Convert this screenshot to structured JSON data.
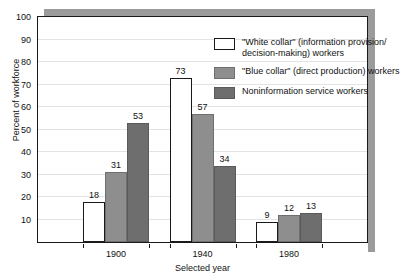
{
  "chart_data": {
    "type": "bar",
    "title": "",
    "xlabel": "Selected year",
    "ylabel": "Percent of workforce",
    "categories": [
      "1900",
      "1940",
      "1980"
    ],
    "series": [
      {
        "name": "\"White collar\" (information provision/decision-making) workers",
        "legend_line1": "\"White collar\" (information provision/",
        "legend_line2": "decision-making) workers",
        "color": "#ffffff",
        "values": [
          18,
          73,
          9
        ]
      },
      {
        "name": "\"Blue collar\" (direct production) workers",
        "legend_line1": "\"Blue collar\" (direct production) workers",
        "legend_line2": "",
        "color": "#8e8e8e",
        "values": [
          31,
          57,
          12
        ]
      },
      {
        "name": "Noninformation service workers",
        "legend_line1": "Noninformation service workers",
        "legend_line2": "",
        "color": "#6e6e6e",
        "values": [
          53,
          34,
          13
        ]
      }
    ],
    "groups": [
      {
        "category": "1900",
        "white_collar": 18,
        "blue_collar": 73,
        "noninformation": 9
      },
      {
        "category": "1940",
        "white_collar": 31,
        "blue_collar": 57,
        "noninformation": 12
      },
      {
        "category": "1980",
        "white_collar": 53,
        "blue_collar": 34,
        "noninformation": 13
      }
    ],
    "ylim": [
      0,
      100
    ],
    "yticks": [
      10,
      20,
      30,
      40,
      50,
      60,
      70,
      80,
      90,
      100
    ],
    "ytick_labels": [
      "10",
      "20",
      "30",
      "40",
      "50",
      "60",
      "70",
      "80",
      "90",
      "100"
    ],
    "grid": true,
    "legend_position": "top-right"
  },
  "axes": {
    "y_title": "Percent of workforce",
    "x_title": "Selected year"
  }
}
